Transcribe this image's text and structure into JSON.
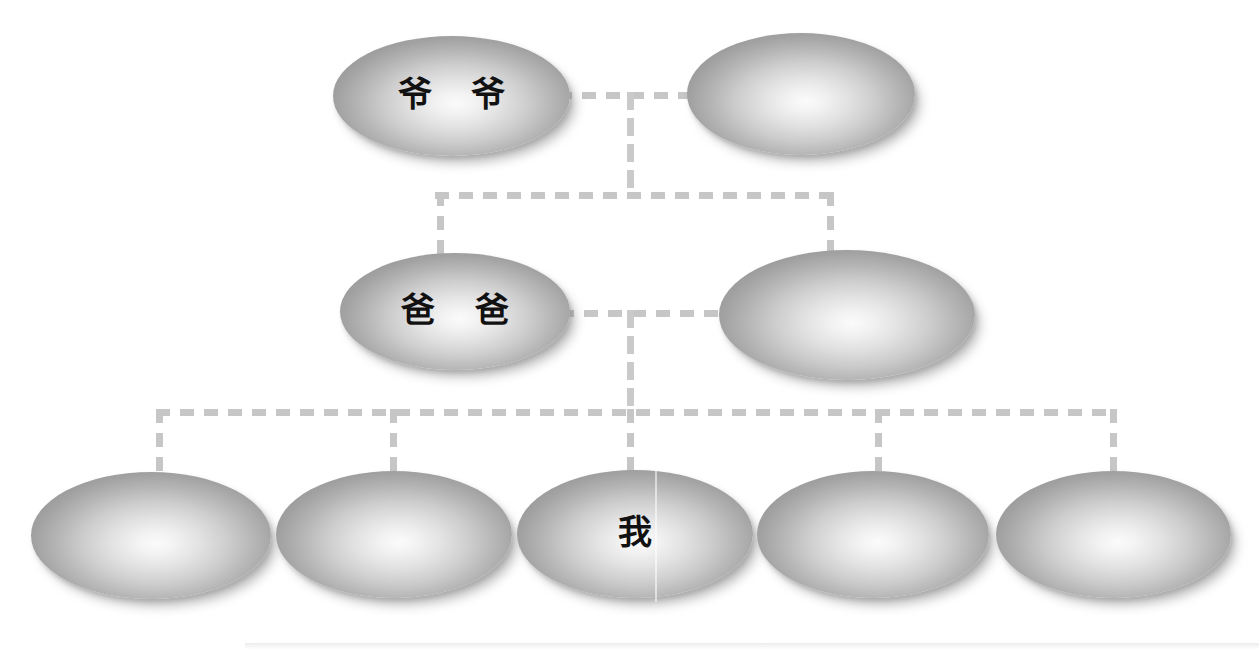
{
  "diagram": {
    "background_color": "#ffffff",
    "line_color": "#c6c6c6",
    "node_fill_light": "#fbfbfb",
    "node_fill_dark": "#969696",
    "text_color": "#111111",
    "generations": [
      {
        "name": "grandparents",
        "nodes": [
          {
            "id": "grandfather",
            "label": "爷 爷"
          },
          {
            "id": "grandmother",
            "label": ""
          }
        ]
      },
      {
        "name": "parents",
        "nodes": [
          {
            "id": "father",
            "label": "爸 爸"
          },
          {
            "id": "mother",
            "label": ""
          }
        ]
      },
      {
        "name": "children",
        "nodes": [
          {
            "id": "sibling-1",
            "label": ""
          },
          {
            "id": "sibling-2",
            "label": ""
          },
          {
            "id": "self",
            "label": "我"
          },
          {
            "id": "sibling-4",
            "label": ""
          },
          {
            "id": "sibling-5",
            "label": ""
          }
        ]
      }
    ]
  }
}
